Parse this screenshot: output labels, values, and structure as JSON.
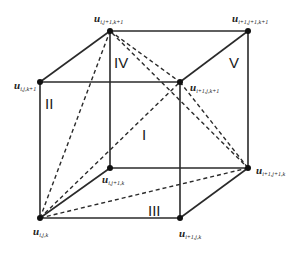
{
  "diagram": {
    "type": "cube-decomposition",
    "colors": {
      "edge": "#2a2a2a",
      "vertex": "#111111",
      "background": "#ffffff"
    },
    "vertices": {
      "A": {
        "base": "u",
        "sub": "i,j,k",
        "x": 40,
        "y": 218
      },
      "B": {
        "base": "u",
        "sub": "i+1,j,k",
        "x": 180,
        "y": 218
      },
      "C": {
        "base": "u",
        "sub": "i,j,k+1",
        "x": 40,
        "y": 82
      },
      "D": {
        "base": "u",
        "sub": "i+1,j,k+1",
        "x": 180,
        "y": 82
      },
      "E": {
        "base": "u",
        "sub": "i,j+1,k",
        "x": 110,
        "y": 168
      },
      "F": {
        "base": "u",
        "sub": "i+1,j+1,k",
        "x": 248,
        "y": 168
      },
      "G": {
        "base": "u",
        "sub": "i,j+1,k+1",
        "x": 110,
        "y": 31
      },
      "H": {
        "base": "u",
        "sub": "i+1,j+1,k+1",
        "x": 248,
        "y": 31
      }
    },
    "regions": [
      {
        "label": "I",
        "x": 145,
        "y": 135
      },
      {
        "label": "II",
        "x": 47,
        "y": 104
      },
      {
        "label": "III",
        "x": 152,
        "y": 213
      },
      {
        "label": "IV",
        "x": 118,
        "y": 63
      },
      {
        "label": "V",
        "x": 233,
        "y": 63
      }
    ],
    "solid_edges": [
      [
        "A",
        "B"
      ],
      [
        "C",
        "D"
      ],
      [
        "A",
        "C"
      ],
      [
        "B",
        "D"
      ],
      [
        "E",
        "F"
      ],
      [
        "G",
        "H"
      ],
      [
        "E",
        "G"
      ],
      [
        "F",
        "H"
      ],
      [
        "A",
        "E"
      ],
      [
        "B",
        "F"
      ],
      [
        "C",
        "G"
      ],
      [
        "D",
        "H"
      ]
    ],
    "dashed_edges": [
      [
        "A",
        "G"
      ],
      [
        "A",
        "D"
      ],
      [
        "A",
        "F"
      ],
      [
        "G",
        "D"
      ],
      [
        "G",
        "F"
      ],
      [
        "D",
        "F"
      ]
    ]
  }
}
